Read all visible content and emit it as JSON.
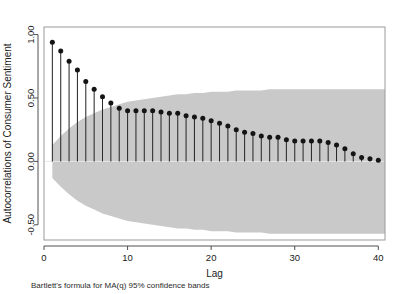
{
  "chart_data": {
    "type": "line",
    "title": "",
    "subtitle": "",
    "xlabel": "Lag",
    "ylabel": "Autocorrelations of Consumer Sentiment",
    "caption": "Bartlett's formula for MA(q) 95% confidence bands",
    "xlim": [
      0,
      40.8
    ],
    "ylim": [
      -0.62,
      1.06
    ],
    "xticks": [
      0,
      10,
      20,
      30,
      40
    ],
    "xticklabels": [
      "0",
      "10",
      "20",
      "30",
      "40"
    ],
    "yticks": [
      1.0,
      0.5,
      0.0,
      -0.5
    ],
    "yticklabels": [
      "1.00",
      "0.50",
      "0.00",
      "-0.50"
    ],
    "grid": false,
    "legend": "none",
    "marker": "filled-circle",
    "series": [
      {
        "name": "Autocorrelation",
        "x": [
          1,
          2,
          3,
          4,
          5,
          6,
          7,
          8,
          9,
          10,
          11,
          12,
          13,
          14,
          15,
          16,
          17,
          18,
          19,
          20,
          21,
          22,
          23,
          24,
          25,
          26,
          27,
          28,
          29,
          30,
          31,
          32,
          33,
          34,
          35,
          36,
          37,
          38,
          39,
          40
        ],
        "values": [
          0.94,
          0.87,
          0.79,
          0.72,
          0.63,
          0.57,
          0.51,
          0.46,
          0.42,
          0.4,
          0.4,
          0.4,
          0.4,
          0.39,
          0.38,
          0.38,
          0.36,
          0.35,
          0.34,
          0.32,
          0.3,
          0.28,
          0.25,
          0.23,
          0.22,
          0.2,
          0.19,
          0.19,
          0.17,
          0.16,
          0.16,
          0.16,
          0.16,
          0.15,
          0.13,
          0.1,
          0.06,
          0.03,
          0.02,
          0.01
        ]
      }
    ],
    "confidence_band": {
      "label": "Bartlett 95% confidence band",
      "color": "#c9c9c9",
      "upper": [
        0.13,
        0.2,
        0.26,
        0.31,
        0.35,
        0.38,
        0.41,
        0.43,
        0.45,
        0.47,
        0.48,
        0.49,
        0.5,
        0.51,
        0.52,
        0.53,
        0.53,
        0.54,
        0.54,
        0.55,
        0.55,
        0.55,
        0.56,
        0.56,
        0.56,
        0.56,
        0.57,
        0.57,
        0.57,
        0.57,
        0.57,
        0.57,
        0.57,
        0.57,
        0.57,
        0.57,
        0.57,
        0.57,
        0.57,
        0.57
      ],
      "lower": [
        -0.13,
        -0.2,
        -0.26,
        -0.31,
        -0.35,
        -0.38,
        -0.41,
        -0.43,
        -0.45,
        -0.47,
        -0.48,
        -0.49,
        -0.5,
        -0.51,
        -0.52,
        -0.53,
        -0.53,
        -0.54,
        -0.54,
        -0.55,
        -0.55,
        -0.55,
        -0.56,
        -0.56,
        -0.56,
        -0.56,
        -0.57,
        -0.57,
        -0.57,
        -0.57,
        -0.57,
        -0.57,
        -0.57,
        -0.57,
        -0.57,
        -0.57,
        -0.57,
        -0.57,
        -0.57,
        -0.57
      ]
    }
  }
}
